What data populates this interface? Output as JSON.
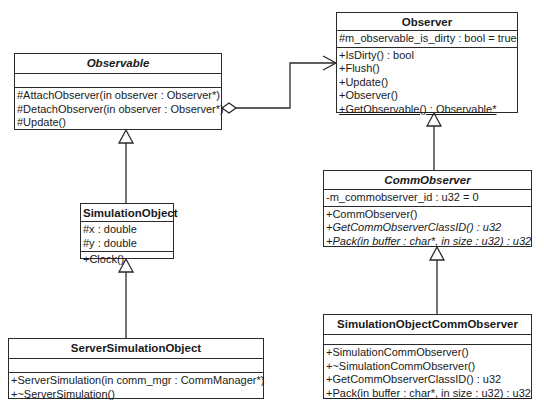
{
  "diagram_type": "UML class diagram",
  "classes": {
    "observable": {
      "name": "Observable",
      "abstract": true,
      "attributes": [],
      "operations": [
        {
          "text": "#AttachObserver(in observer : Observer*)"
        },
        {
          "text": "#DetachObserver(in observer : Observer*)"
        },
        {
          "text": "#Update()"
        }
      ]
    },
    "observer": {
      "name": "Observer",
      "abstract": false,
      "attributes": [
        {
          "text": "#m_observable_is_dirty : bool = true"
        }
      ],
      "operations": [
        {
          "text": "+IsDirty() : bool"
        },
        {
          "text": "+Flush()"
        },
        {
          "text": "+Update()"
        },
        {
          "text": "+Observer()"
        },
        {
          "text": "+GetObservable() : Observable*",
          "underline": true
        }
      ]
    },
    "comm_observer": {
      "name": "CommObserver",
      "abstract": true,
      "attributes": [
        {
          "text": "-m_commobserver_id : u32 = 0"
        }
      ],
      "operations": [
        {
          "text": "+CommObserver()"
        },
        {
          "text": "+GetCommObserverClassID() : u32",
          "italic": true
        },
        {
          "text": "+Pack(in buffer : char*, in size : u32) : u32",
          "italic": true
        }
      ]
    },
    "simulation_object": {
      "name": "SimulationObject",
      "abstract": false,
      "attributes": [
        {
          "text": "#x : double"
        },
        {
          "text": "#y : double"
        }
      ],
      "operations": [
        {
          "text": "+Clock()"
        }
      ]
    },
    "server_simulation_object": {
      "name": "ServerSimulationObject",
      "abstract": false,
      "attributes": [],
      "operations": [
        {
          "text": "+ServerSimulation(in comm_mgr : CommManager*)"
        },
        {
          "text": "+~ServerSimulation()"
        }
      ]
    },
    "simulation_object_comm_observer": {
      "name": "SimulationObjectCommObserver",
      "abstract": false,
      "attributes": [],
      "operations": [
        {
          "text": "+SimulationCommObserver()"
        },
        {
          "text": "+~SimulationCommObserver()"
        },
        {
          "text": "+GetCommObserverClassID() : u32"
        },
        {
          "text": "+Pack(in buffer : char*, in size : u32) : u32",
          "underline": true
        }
      ]
    }
  },
  "relationships": [
    {
      "type": "aggregation",
      "from": "Observable",
      "to": "Observer",
      "navigable_to": "Observer"
    },
    {
      "type": "generalization",
      "child": "SimulationObject",
      "parent": "Observable"
    },
    {
      "type": "generalization",
      "child": "ServerSimulationObject",
      "parent": "SimulationObject"
    },
    {
      "type": "generalization",
      "child": "CommObserver",
      "parent": "Observer"
    },
    {
      "type": "generalization",
      "child": "SimulationObjectCommObserver",
      "parent": "CommObserver"
    }
  ]
}
